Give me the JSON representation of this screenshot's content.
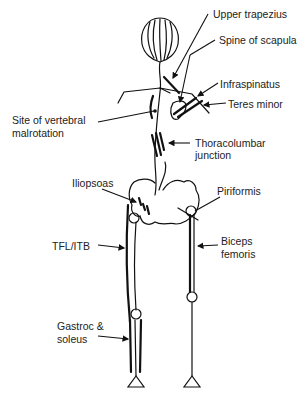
{
  "figure": {
    "labels": {
      "upper_trapezius": "Upper trapezius",
      "spine_of_scapula": "Spine of scapula",
      "infraspinatus": "Infraspinatus",
      "teres_minor": "Teres minor",
      "vertebral_line1": "Site of vertebral",
      "vertebral_line2": "malrotation",
      "thoracolumbar_line1": "Thoracolumbar",
      "thoracolumbar_line2": "junction",
      "iliopsoas": "Iliopsoas",
      "piriformis": "Piriformis",
      "biceps_line1": "Biceps",
      "biceps_line2": "femoris",
      "tfl_itb": "TFL/ITB",
      "gastroc_line1": "Gastroc &",
      "gastroc_line2": "soleus"
    },
    "colors": {
      "line": "#111111",
      "text": "#222222",
      "background": "#ffffff"
    }
  }
}
